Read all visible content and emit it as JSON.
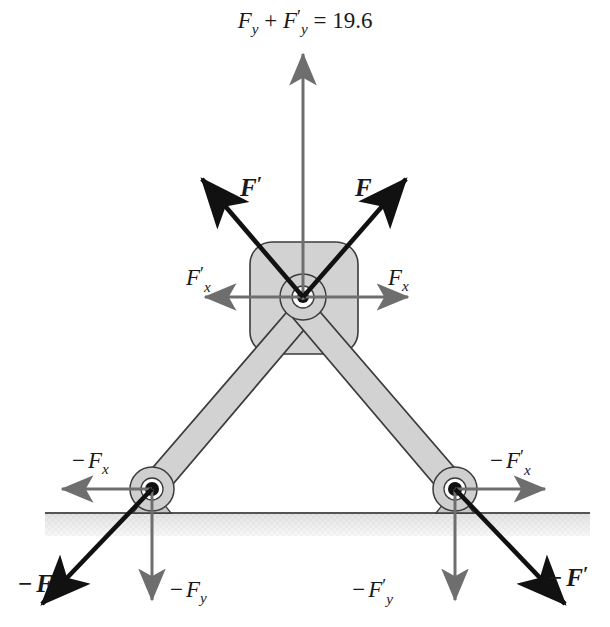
{
  "figure": {
    "type": "physics-free-body-diagram",
    "colors": {
      "black": "#111111",
      "gray_arrow": "#6e6e6e",
      "member_fill": "#d2d2d2",
      "member_stroke": "#3c3c3c",
      "ground_line": "#555555",
      "ground_hatch": "#e8e8e8",
      "background": "#ffffff"
    },
    "equation": {
      "text": "F_y + F'_y = 19.6",
      "lhs_first": "F",
      "lhs_first_sub": "y",
      "lhs_second": "F",
      "lhs_second_prime": "′",
      "lhs_second_sub": "y",
      "equals": "=",
      "value": "19.6"
    },
    "labels": {
      "resultant_vertical": "F_y + F'_y = 19.6",
      "force_left_upper": "F′",
      "force_right_upper": "F",
      "component_left_upper": "F′_x",
      "component_right_upper": "F_x",
      "reaction_left_horizontal": "−F_x",
      "reaction_right_horizontal": "−F′_x",
      "reaction_left_diagonal": "−F",
      "reaction_left_vertical": "−F_y",
      "reaction_right_vertical": "−F′_y",
      "reaction_right_diagonal": "−F′"
    },
    "glyphs": {
      "F": "F",
      "prime": "′",
      "minus": "−",
      "sub_x": "x",
      "sub_y": "y",
      "plus": "+",
      "equals": "=",
      "result_value": "19.6"
    },
    "geometry": {
      "hub_center": [
        303,
        297
      ],
      "left_pivot": [
        152,
        489
      ],
      "right_pivot": [
        455,
        489
      ],
      "ground_y": 513,
      "ground_x_start": 45,
      "ground_x_end": 590
    }
  }
}
